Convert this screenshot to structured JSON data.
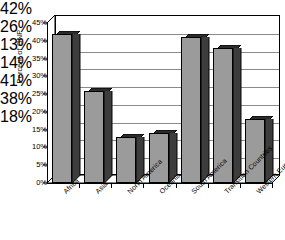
{
  "chart_data": {
    "type": "bar",
    "title": "",
    "xlabel": "",
    "ylabel": "Percent of GNP",
    "categories": [
      "Africa",
      "Asia",
      "North America",
      "Oceania",
      "South America",
      "Transition Countries",
      "Western Europe"
    ],
    "values": [
      42,
      26,
      13,
      14,
      41,
      38,
      18
    ],
    "value_labels": [
      "42%",
      "26%",
      "13%",
      "14%",
      "41%",
      "38%",
      "18%"
    ],
    "ylim": [
      0,
      45
    ],
    "ytick_values": [
      0,
      5,
      10,
      15,
      20,
      25,
      30,
      35,
      40,
      45
    ],
    "ytick_labels": [
      "0%",
      "5%",
      "10%",
      "15%",
      "20%",
      "25%",
      "30%",
      "35%",
      "40%",
      "45%"
    ],
    "grid": true,
    "legend": "none",
    "style": "3d-column",
    "colors": {
      "bar_face": "#9b9b9b",
      "bar_side": "#3d3d3d",
      "bar_top": "#2b2b2b",
      "gridline": "#8a8a8a",
      "axis": "#000000",
      "background": "#ffffff",
      "text": "#000000"
    }
  }
}
